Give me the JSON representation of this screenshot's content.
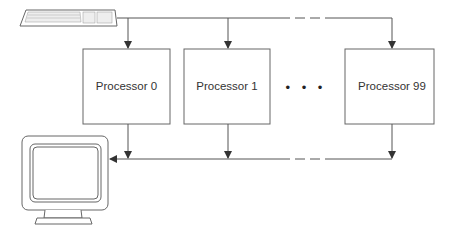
{
  "diagram": {
    "type": "multiprocessor-architecture",
    "input_device": "keyboard",
    "output_device": "monitor",
    "processors": [
      {
        "label": "Processor 0"
      },
      {
        "label": "Processor 1"
      },
      {
        "label": "Processor 99"
      }
    ],
    "ellipsis": "• • •",
    "colors": {
      "line": "#555555",
      "box_border": "#666666",
      "text": "#333333"
    }
  }
}
